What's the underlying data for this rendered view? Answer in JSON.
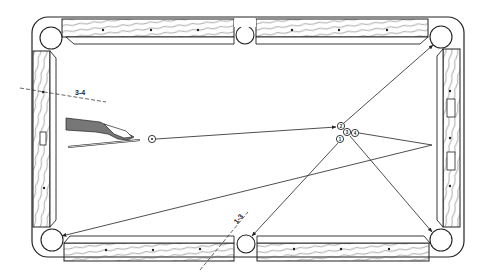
{
  "diagram": {
    "type": "pool-table-shot-diagram",
    "colors": {
      "ink": "#222222",
      "paper": "#ffffff",
      "wood_grain": "#555555"
    },
    "table": {
      "pockets": [
        "top-left",
        "top-middle",
        "top-right",
        "bottom-left",
        "bottom-middle",
        "bottom-right"
      ]
    },
    "labels": {
      "aim_line_a": "3-4",
      "aim_line_b": "1-3"
    },
    "balls": [
      {
        "id": "cue",
        "label": "",
        "x": 152,
        "y": 139
      },
      {
        "id": "ball-2",
        "label": "2",
        "x": 341,
        "y": 126
      },
      {
        "id": "ball-3",
        "label": "3",
        "x": 347,
        "y": 132
      },
      {
        "id": "ball-4",
        "label": "4",
        "x": 355,
        "y": 133
      },
      {
        "id": "ball-1",
        "label": "1",
        "x": 340,
        "y": 139
      }
    ],
    "shot_paths": [
      {
        "from": "cue",
        "to": "ball-2",
        "desc": "cue ball path"
      },
      {
        "from": "ball-2",
        "to": "top-right",
        "desc": "ball 2 to top-right pocket"
      },
      {
        "from": "ball-1",
        "to": "bottom-middle",
        "desc": "ball 1 to bottom-middle pocket"
      },
      {
        "from": "ball-3",
        "to": "bottom-right",
        "desc": "ball 3 to bottom-right pocket"
      },
      {
        "from": "ball-4",
        "to": "right-rail",
        "desc": "ball 4 to right rail then bottom-left pocket"
      }
    ]
  }
}
